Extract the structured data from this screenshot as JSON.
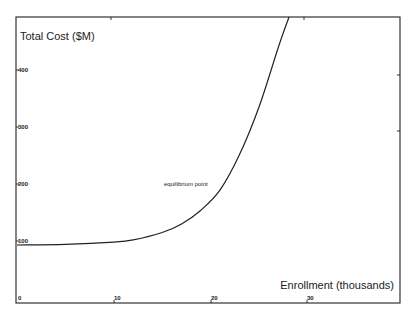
{
  "chart_data": {
    "type": "line",
    "title": "",
    "ylabel": "Total Cost ($M)",
    "xlabel": "Enrollment (thousands)",
    "x_ticks": [
      "0",
      "10",
      "20",
      "30"
    ],
    "y_ticks": [
      "100",
      "200",
      "300",
      "400"
    ],
    "xlim": [
      0,
      39.5
    ],
    "ylim": [
      0,
      493
    ],
    "grid": false,
    "legend": null,
    "series": [
      {
        "name": "Total Cost",
        "x": [
          0,
          5,
          10,
          12,
          15,
          17,
          19,
          21,
          23,
          25,
          27,
          28.1
        ],
        "y": [
          93,
          94,
          98,
          102,
          115,
          130,
          154,
          190,
          252,
          335,
          440,
          493
        ]
      }
    ],
    "annotations": [
      {
        "text": "equilibrium point",
        "x": 19.5,
        "y": 200
      }
    ]
  },
  "colors": {
    "line": "#222222",
    "frame": "#333333",
    "background": "#ffffff"
  }
}
